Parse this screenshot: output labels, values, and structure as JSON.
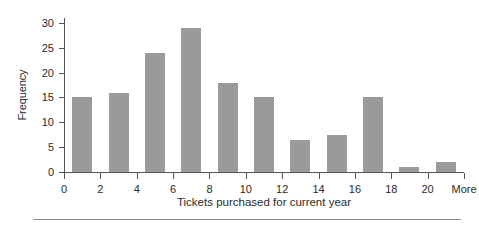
{
  "chart_data": {
    "type": "bar",
    "title": "",
    "subtitle": "",
    "xlabel": "Tickets purchased for current year",
    "ylabel": "Frequency",
    "grid": false,
    "legend": null,
    "bar_color": "#9a9a9a",
    "axis_color": "#555555",
    "ylim": [
      0,
      31
    ],
    "ytick_values": [
      0,
      5,
      10,
      15,
      20,
      25,
      30
    ],
    "ytick_labels": [
      "0",
      "5",
      "10",
      "15",
      "20",
      "25",
      "30"
    ],
    "xlim": [
      0,
      22
    ],
    "xtick_values": [
      0,
      2,
      4,
      6,
      8,
      10,
      12,
      14,
      16,
      18,
      20,
      22
    ],
    "xtick_labels": [
      "0",
      "2",
      "4",
      "6",
      "8",
      "10",
      "12",
      "14",
      "16",
      "18",
      "20",
      "More"
    ],
    "bin_centers": [
      1,
      3,
      5,
      7,
      9,
      11,
      13,
      15,
      17,
      19,
      21
    ],
    "categories": [
      "1",
      "3",
      "5",
      "7",
      "9",
      "11",
      "13",
      "15",
      "17",
      "19",
      "21"
    ],
    "values": [
      15,
      16,
      24,
      29,
      18,
      15,
      6.5,
      7.5,
      15,
      1,
      2
    ]
  }
}
